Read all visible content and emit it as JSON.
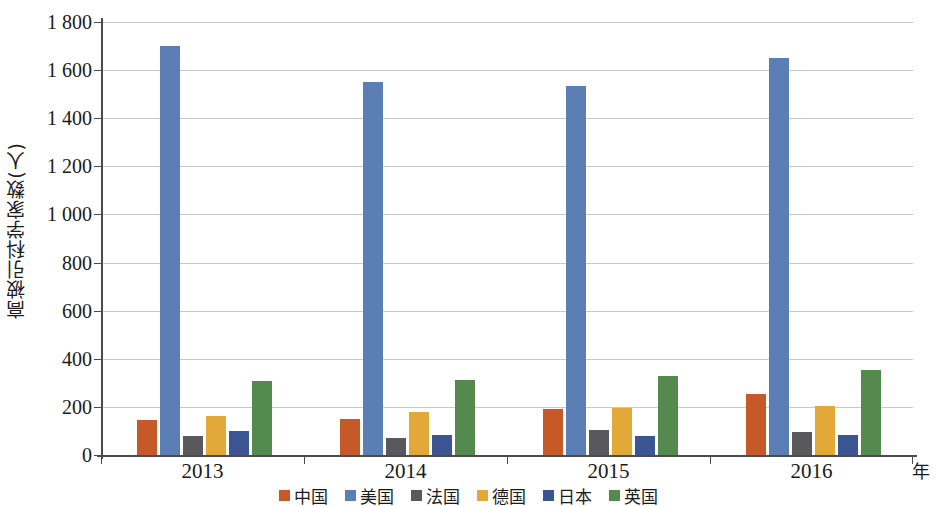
{
  "chart_data": {
    "type": "bar",
    "title": "",
    "xlabel": "年",
    "ylabel": "高被引科学家数(人)",
    "categories": [
      "2013",
      "2014",
      "2015",
      "2016"
    ],
    "ylim": [
      0,
      1800
    ],
    "ytick_step": 200,
    "ytick_labels": [
      "0",
      "200",
      "400",
      "600",
      "800",
      "1 000",
      "1 200",
      "1 400",
      "1 600",
      "1 800"
    ],
    "ytick_values": [
      0,
      200,
      400,
      600,
      800,
      1000,
      1200,
      1400,
      1600,
      1800
    ],
    "grid": true,
    "legend_position": "bottom",
    "series": [
      {
        "name": "中国",
        "color": "#c55a28",
        "values": [
          145,
          148,
          190,
          255
        ]
      },
      {
        "name": "美国",
        "color": "#5b7fb4",
        "values": [
          1700,
          1550,
          1535,
          1650
        ]
      },
      {
        "name": "法国",
        "color": "#59595b",
        "values": [
          80,
          72,
          105,
          95
        ]
      },
      {
        "name": "德国",
        "color": "#e2a938",
        "values": [
          163,
          180,
          197,
          203
        ]
      },
      {
        "name": "日本",
        "color": "#3a5591",
        "values": [
          100,
          85,
          80,
          83
        ]
      },
      {
        "name": "英国",
        "color": "#558a4e",
        "values": [
          308,
          313,
          330,
          352
        ]
      }
    ]
  },
  "legend": {
    "items": [
      {
        "label": "中国",
        "color": "#c55a28"
      },
      {
        "label": "美国",
        "color": "#5b7fb4"
      },
      {
        "label": "法国",
        "color": "#59595b"
      },
      {
        "label": "德国",
        "color": "#e2a938"
      },
      {
        "label": "日本",
        "color": "#3a5591"
      },
      {
        "label": "英国",
        "color": "#558a4e"
      }
    ]
  },
  "axes": {
    "y_title": "高被引科学家数(人)",
    "x_title": "年"
  }
}
